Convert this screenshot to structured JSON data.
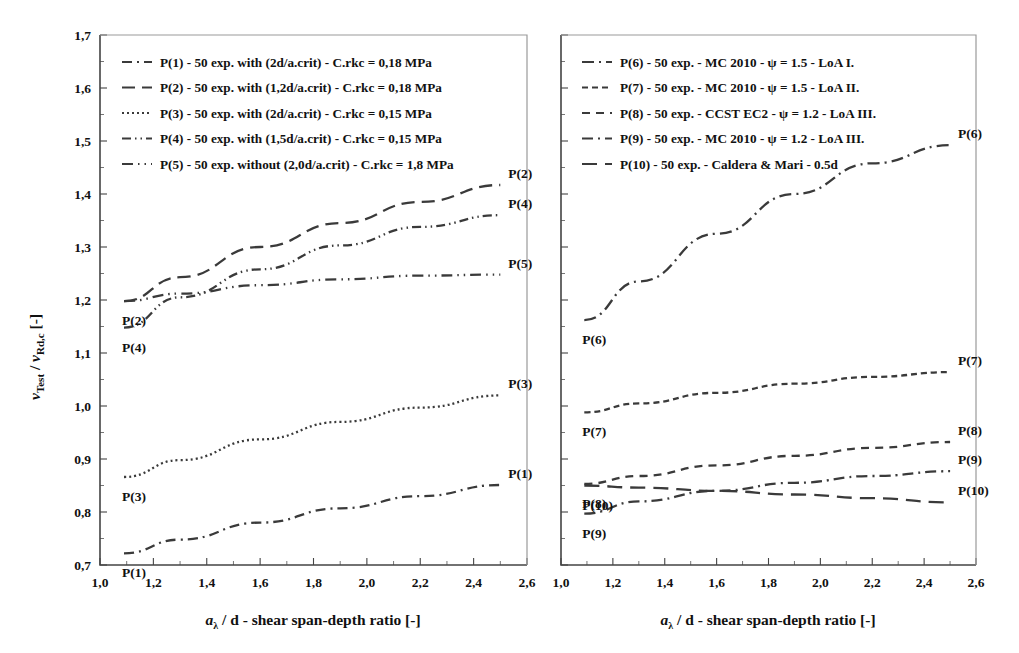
{
  "figure": {
    "background": "#ffffff",
    "line_color": "#3a3a3a"
  },
  "axes": {
    "y": {
      "label_main": "v",
      "label_sub1": "Test",
      "label_slash": " / ",
      "label_main2": "v",
      "label_sub2": "Rd,c",
      "label_unit": "  [-]",
      "full_label": "vTest / vRd,c  [-]",
      "ticks": [
        "0,7",
        "0,8",
        "0,9",
        "1,0",
        "1,1",
        "1,2",
        "1,3",
        "1,4",
        "1,5",
        "1,6",
        "1,7"
      ],
      "min": 0.7,
      "max": 1.7
    },
    "x": {
      "label_main": "a",
      "label_sub": "λ",
      "label_rest": " / d - shear span-depth ratio [-]",
      "full_label": "aλ / d - shear span-depth ratio [-]",
      "ticks": [
        "1,0",
        "1,2",
        "1,4",
        "1,6",
        "1,8",
        "2,0",
        "2,2",
        "2,4",
        "2,6"
      ],
      "min": 1.0,
      "max": 2.6
    }
  },
  "left_panel": {
    "legend": [
      {
        "key": "P(1)",
        "label": "P(1) - 50 exp. with (2d/a.crit) - C.rkc = 0,18 MPa",
        "dash": "10,5,2,5"
      },
      {
        "key": "P(2)",
        "label": "P(2) - 50 exp. with (1,2d/a.crit) - C.rkc = 0,18 MPa",
        "dash": "13,7"
      },
      {
        "key": "P(3)",
        "label": "P(3) - 50 exp. with (2d/a.crit) - C.rkc = 0,15 MPa",
        "dash": "2,3"
      },
      {
        "key": "P(4)",
        "label": "P(4) - 50 exp. with (1,5d/a.crit) - C.rkc = 0,15 MPa",
        "dash": "9,4,1.5,4,1.5,4"
      },
      {
        "key": "P(5)",
        "label": "P(5) - 50 exp. without (2,0d/a.crit) - C.rkc = 1,8 MPa",
        "dash": "11,5,1.5,5,1.5,5"
      }
    ]
  },
  "right_panel": {
    "legend": [
      {
        "key": "P(6)",
        "label": "P(6) - 50 exp. - MC 2010 - ψ = 1.5 - LoA I.",
        "dash": "12,5,2,5"
      },
      {
        "key": "P(7)",
        "label": "P(7) - 50 exp. - MC 2010 - ψ = 1.5 - LoA II.",
        "dash": "6,4"
      },
      {
        "key": "P(8)",
        "label": "P(8) - 50 exp. - CCST EC2 - ψ = 1.2 - LoA III.",
        "dash": "8,6"
      },
      {
        "key": "P(9)",
        "label": "P(9) - 50 exp. - MC 2010 - ψ = 1.2 - LoA III.",
        "dash": "11,5,2,5"
      },
      {
        "key": "P(10)",
        "label": "P(10) - 50 exp. - Caldera & Mari - 0.5d",
        "dash": "15,8"
      }
    ]
  },
  "chart_data": {
    "type": "line",
    "panels": [
      {
        "id": "left",
        "title": "",
        "xlabel": "aλ / d - shear span-depth ratio [-]",
        "ylabel": "vTest / vRd,c [-]",
        "xlim": [
          1.0,
          2.6
        ],
        "ylim": [
          0.7,
          1.7
        ],
        "grid": false,
        "legend_position": "top-left-inside",
        "series": [
          {
            "name": "P(1)",
            "label_start": "P(1)",
            "label_end": "P(1)",
            "x": [
              1.09,
              1.3,
              1.6,
              1.9,
              2.2,
              2.5
            ],
            "y": [
              0.722,
              0.748,
              0.78,
              0.807,
              0.83,
              0.851
            ]
          },
          {
            "name": "P(2)",
            "label_start": "P(2)",
            "label_end": "P(2)",
            "x": [
              1.09,
              1.3,
              1.6,
              1.9,
              2.2,
              2.5
            ],
            "y": [
              1.198,
              1.243,
              1.3,
              1.345,
              1.385,
              1.417
            ]
          },
          {
            "name": "P(3)",
            "label_start": "P(3)",
            "label_end": "P(3)",
            "x": [
              1.09,
              1.3,
              1.6,
              1.9,
              2.2,
              2.5
            ],
            "y": [
              0.866,
              0.898,
              0.937,
              0.97,
              0.997,
              1.02
            ]
          },
          {
            "name": "P(4)",
            "label_start": "P(4)",
            "label_end": "P(4)",
            "x": [
              1.09,
              1.3,
              1.6,
              1.9,
              2.2,
              2.5
            ],
            "y": [
              1.148,
              1.205,
              1.258,
              1.303,
              1.338,
              1.36
            ]
          },
          {
            "name": "P(5)",
            "label_start": "",
            "label_end": "P(5)",
            "x": [
              1.09,
              1.3,
              1.6,
              1.9,
              2.2,
              2.5
            ],
            "y": [
              1.198,
              1.212,
              1.228,
              1.239,
              1.246,
              1.248
            ]
          }
        ]
      },
      {
        "id": "right",
        "title": "",
        "xlabel": "aλ / d - shear span-depth ratio [-]",
        "ylabel": "",
        "xlim": [
          1.0,
          2.6
        ],
        "ylim": [
          0.7,
          1.7
        ],
        "grid": false,
        "legend_position": "top-left-inside",
        "series": [
          {
            "name": "P(6)",
            "label_start": "P(6)",
            "label_end": "P(6)",
            "x": [
              1.09,
              1.3,
              1.6,
              1.9,
              2.2,
              2.5
            ],
            "y": [
              1.162,
              1.235,
              1.325,
              1.4,
              1.458,
              1.492
            ]
          },
          {
            "name": "P(7)",
            "label_start": "P(7)",
            "label_end": "P(7)",
            "x": [
              1.09,
              1.3,
              1.6,
              1.9,
              2.2,
              2.5
            ],
            "y": [
              0.988,
              1.005,
              1.025,
              1.042,
              1.055,
              1.064
            ]
          },
          {
            "name": "P(8)",
            "label_start": "P(8)",
            "label_end": "P(8)",
            "x": [
              1.09,
              1.3,
              1.6,
              1.9,
              2.2,
              2.5
            ],
            "y": [
              0.853,
              0.868,
              0.888,
              0.906,
              0.921,
              0.932
            ]
          },
          {
            "name": "P(9)",
            "label_start": "P(9)",
            "label_end": "P(9)",
            "x": [
              1.09,
              1.3,
              1.6,
              1.9,
              2.2,
              2.5
            ],
            "y": [
              0.797,
              0.82,
              0.84,
              0.855,
              0.868,
              0.877
            ]
          },
          {
            "name": "P(10)",
            "label_start": "P(10)",
            "label_end": "P(10)",
            "x": [
              1.09,
              1.3,
              1.6,
              1.9,
              2.2,
              2.5
            ],
            "y": [
              0.85,
              0.846,
              0.84,
              0.833,
              0.826,
              0.818
            ]
          }
        ]
      }
    ]
  }
}
